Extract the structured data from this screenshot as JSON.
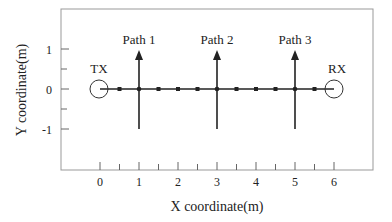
{
  "diagram": {
    "xlabel": "X coordinate(m)",
    "ylabel": "Y coordinate(m)",
    "x_ticks": [
      {
        "label": "0",
        "value": 0
      },
      {
        "label": "1",
        "value": 1
      },
      {
        "label": "2",
        "value": 2
      },
      {
        "label": "3",
        "value": 3
      },
      {
        "label": "4",
        "value": 4
      },
      {
        "label": "5",
        "value": 5
      },
      {
        "label": "6",
        "value": 6
      }
    ],
    "y_ticks": [
      {
        "label": "1",
        "value": 1
      },
      {
        "label": "0",
        "value": 0
      },
      {
        "label": "-1",
        "value": -1
      }
    ],
    "transmitter": {
      "label": "TX",
      "x": 0,
      "y": 0
    },
    "receiver": {
      "label": "RX",
      "x": 6,
      "y": 0
    },
    "paths": [
      {
        "label": "Path 1",
        "x": 1
      },
      {
        "label": "Path 2",
        "x": 3
      },
      {
        "label": "Path 3",
        "x": 5
      }
    ],
    "markers_x": [
      0.5,
      1.5,
      2,
      2.5,
      3.5,
      4,
      4.5,
      5.5
    ],
    "colors": {
      "line": "#222222",
      "frame": "#888888"
    }
  }
}
